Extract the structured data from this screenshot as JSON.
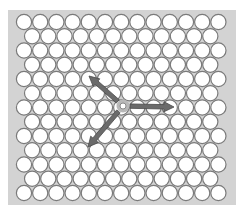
{
  "diagram": {
    "type": "hexagonal-lattice",
    "canvas": {
      "width": 248,
      "height": 216,
      "background": "#ffffff"
    },
    "panel": {
      "x": 8,
      "y": 10,
      "width": 228,
      "height": 195,
      "fill": "#d3d3d3"
    },
    "lattice": {
      "rows": 13,
      "long_row_count": 13,
      "short_row_count": 12,
      "first_center_x": 24,
      "short_row_offset_x": 8.1,
      "pitch_x": 16.2,
      "first_center_y": 22,
      "pitch_y": 14.25,
      "radius": 7.6,
      "circle_fill": "#ffffff",
      "circle_stroke": "#7a7a7a",
      "stroke_width": 1.2
    },
    "origin": {
      "x": 123,
      "y": 106,
      "radius": 3,
      "fill": "#ffffff",
      "stroke": "#8a8a8a",
      "halo_fill": "#b8b8b8"
    },
    "vectors": [
      {
        "name": "vector-right",
        "to": {
          "x": 174,
          "y": 107
        }
      },
      {
        "name": "vector-upper-left",
        "to": {
          "x": 89,
          "y": 76
        }
      },
      {
        "name": "vector-lower-left",
        "to": {
          "x": 88,
          "y": 147
        }
      }
    ],
    "vector_color": "#6b6b6b",
    "vector_edge_color": "#4a4a4a"
  }
}
